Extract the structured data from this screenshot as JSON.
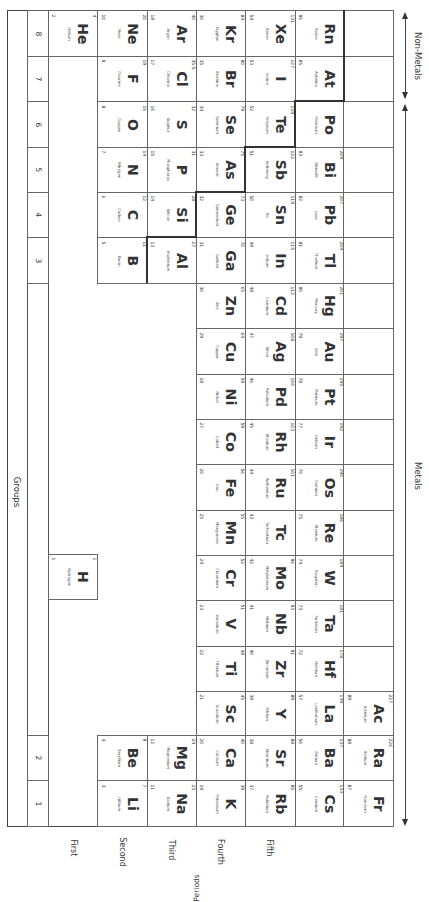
{
  "labels": {
    "groups": "Groups",
    "periods": "Periods",
    "metals": "Metals",
    "non_metals": "Non-Metals"
  },
  "group_numbers": [
    "8",
    "7",
    "6",
    "5",
    "4",
    "3",
    "2",
    "1"
  ],
  "period_labels": [
    "First",
    "Second",
    "Third",
    "Fourth",
    "Fifth"
  ],
  "elements": {
    "He": {
      "symbol": "He",
      "name": "Helium",
      "mass": "4",
      "number": "2"
    },
    "Ne": {
      "symbol": "Ne",
      "name": "Neon",
      "mass": "20",
      "number": "10"
    },
    "Ar": {
      "symbol": "Ar",
      "name": "Argon",
      "mass": "40",
      "number": "18"
    },
    "Kr": {
      "symbol": "Kr",
      "name": "Krypton",
      "mass": "84",
      "number": "36"
    },
    "Xe": {
      "symbol": "Xe",
      "name": "Xenon",
      "mass": "131",
      "number": "54"
    },
    "Rn": {
      "symbol": "Rn",
      "name": "Radon",
      "mass": "",
      "number": "86"
    },
    "F": {
      "symbol": "F",
      "name": "Fluorine",
      "mass": "19",
      "number": "9"
    },
    "Cl": {
      "symbol": "Cl",
      "name": "Chlorine",
      "mass": "35.5",
      "number": "17"
    },
    "Br": {
      "symbol": "Br",
      "name": "Bromine",
      "mass": "80",
      "number": "35"
    },
    "I": {
      "symbol": "I",
      "name": "Iodine",
      "mass": "127",
      "number": "53"
    },
    "At": {
      "symbol": "At",
      "name": "Astatine",
      "mass": "",
      "number": "85"
    },
    "O": {
      "symbol": "O",
      "name": "Oxygen",
      "mass": "16",
      "number": "8"
    },
    "S": {
      "symbol": "S",
      "name": "Sulphur",
      "mass": "32",
      "number": "16"
    },
    "Se": {
      "symbol": "Se",
      "name": "Selenium",
      "mass": "79",
      "number": "34"
    },
    "Te": {
      "symbol": "Te",
      "name": "Tellurium",
      "mass": "128",
      "number": "52"
    },
    "Po": {
      "symbol": "Po",
      "name": "Polonium",
      "mass": "",
      "number": ""
    },
    "N": {
      "symbol": "N",
      "name": "Nitrogen",
      "mass": "14",
      "number": "7"
    },
    "P": {
      "symbol": "P",
      "name": "Phosphorus",
      "mass": "31",
      "number": "15"
    },
    "As": {
      "symbol": "As",
      "name": "Arsenic",
      "mass": "75",
      "number": "33"
    },
    "Sb": {
      "symbol": "Sb",
      "name": "Antimony",
      "mass": "122",
      "number": "51"
    },
    "Bi": {
      "symbol": "Bi",
      "name": "Bismuth",
      "mass": "209",
      "number": "83"
    },
    "C": {
      "symbol": "C",
      "name": "Carbon",
      "mass": "12",
      "number": "6"
    },
    "Si": {
      "symbol": "Si",
      "name": "Silicon",
      "mass": "28",
      "number": "14"
    },
    "Ge": {
      "symbol": "Ge",
      "name": "Germanium",
      "mass": "73",
      "number": "32"
    },
    "Sn": {
      "symbol": "Sn",
      "name": "Tin",
      "mass": "119",
      "number": "50"
    },
    "Pb": {
      "symbol": "Pb",
      "name": "Lead",
      "mass": "207",
      "number": "82"
    },
    "B": {
      "symbol": "B",
      "name": "Boron",
      "mass": "11",
      "number": "5"
    },
    "Al": {
      "symbol": "Al",
      "name": "Aluminium",
      "mass": "27",
      "number": "13"
    },
    "Ga": {
      "symbol": "Ga",
      "name": "Gallium",
      "mass": "70",
      "number": "31"
    },
    "In": {
      "symbol": "In",
      "name": "Indium",
      "mass": "115",
      "number": "49"
    },
    "Tl": {
      "symbol": "Tl",
      "name": "Thallium",
      "mass": "204",
      "number": "81"
    },
    "Zn": {
      "symbol": "Zn",
      "name": "Zinc",
      "mass": "65",
      "number": "30"
    },
    "Cd": {
      "symbol": "Cd",
      "name": "Cadmium",
      "mass": "112",
      "number": "48"
    },
    "Hg": {
      "symbol": "Hg",
      "name": "Mercury",
      "mass": "201",
      "number": "80"
    },
    "Cu": {
      "symbol": "Cu",
      "name": "Copper",
      "mass": "64",
      "number": "29"
    },
    "Ag": {
      "symbol": "Ag",
      "name": "Silver",
      "mass": "108",
      "number": "47"
    },
    "Au": {
      "symbol": "Au",
      "name": "Gold",
      "mass": "197",
      "number": "79"
    },
    "Ni": {
      "symbol": "Ni",
      "name": "Nickel",
      "mass": "59",
      "number": "28"
    },
    "Pd": {
      "symbol": "Pd",
      "name": "Palladium",
      "mass": "106",
      "number": "46"
    },
    "Pt": {
      "symbol": "Pt",
      "name": "Platinum",
      "mass": "195",
      "number": "78"
    },
    "Co": {
      "symbol": "Co",
      "name": "Cobalt",
      "mass": "59",
      "number": "27"
    },
    "Rh": {
      "symbol": "Rh",
      "name": "Rhodium",
      "mass": "103",
      "number": "45"
    },
    "Ir": {
      "symbol": "Ir",
      "name": "Iridium",
      "mass": "192",
      "number": "77"
    },
    "Fe": {
      "symbol": "Fe",
      "name": "Iron",
      "mass": "56",
      "number": "26"
    },
    "Ru": {
      "symbol": "Ru",
      "name": "Ruthenium",
      "mass": "101",
      "number": "44"
    },
    "Os": {
      "symbol": "Os",
      "name": "Osmium",
      "mass": "190",
      "number": "76"
    },
    "Mn": {
      "symbol": "Mn",
      "name": "Manganese",
      "mass": "55",
      "number": "25"
    },
    "Tc": {
      "symbol": "Tc",
      "name": "Technetium",
      "mass": "",
      "number": "43"
    },
    "Re": {
      "symbol": "Re",
      "name": "Rhenium",
      "mass": "186",
      "number": "75"
    },
    "Cr": {
      "symbol": "Cr",
      "name": "Chromium",
      "mass": "52",
      "number": "24"
    },
    "Mo": {
      "symbol": "Mo",
      "name": "Molybdenum",
      "mass": "96",
      "number": "42"
    },
    "W": {
      "symbol": "W",
      "name": "Tungsten",
      "mass": "184",
      "number": "74"
    },
    "V": {
      "symbol": "V",
      "name": "Vanadium",
      "mass": "51",
      "number": "23"
    },
    "Nb": {
      "symbol": "Nb",
      "name": "Niobium",
      "mass": "93",
      "number": "41"
    },
    "Ta": {
      "symbol": "Ta",
      "name": "Tantalum",
      "mass": "181",
      "number": "73"
    },
    "Ti": {
      "symbol": "Ti",
      "name": "Titanium",
      "mass": "48",
      "number": "22"
    },
    "Zr": {
      "symbol": "Zr",
      "name": "Zirconium",
      "mass": "91",
      "number": "40"
    },
    "Hf": {
      "symbol": "Hf",
      "name": "Hafnium",
      "mass": "178",
      "number": "72"
    },
    "Sc": {
      "symbol": "Sc",
      "name": "Scandium",
      "mass": "45",
      "number": "21"
    },
    "Y": {
      "symbol": "Y",
      "name": "Yttrium",
      "mass": "89",
      "number": "39"
    },
    "La": {
      "symbol": "La",
      "name": "Lanthanum",
      "mass": "139",
      "number": "57"
    },
    "Ac": {
      "symbol": "Ac",
      "name": "Actinium",
      "mass": "227",
      "number": "89"
    },
    "Be": {
      "symbol": "Be",
      "name": "Beryllium",
      "mass": "9",
      "number": "4"
    },
    "Mg": {
      "symbol": "Mg",
      "name": "Magnesium",
      "mass": "24",
      "number": "12"
    },
    "Ca": {
      "symbol": "Ca",
      "name": "Calcium",
      "mass": "40",
      "number": "20"
    },
    "Sr": {
      "symbol": "Sr",
      "name": "Strontium",
      "mass": "88",
      "number": "38"
    },
    "Ba": {
      "symbol": "Ba",
      "name": "Barium",
      "mass": "137",
      "number": "56"
    },
    "Ra": {
      "symbol": "Ra",
      "name": "Radium",
      "mass": "226",
      "number": "88"
    },
    "Li": {
      "symbol": "Li",
      "name": "Lithium",
      "mass": "7",
      "number": "3"
    },
    "Na": {
      "symbol": "Na",
      "name": "Sodium",
      "mass": "23",
      "number": "11"
    },
    "K": {
      "symbol": "K",
      "name": "Potassium",
      "mass": "39",
      "number": "19"
    },
    "Rb": {
      "symbol": "Rb",
      "name": "Rubidium",
      "mass": "85",
      "number": "37"
    },
    "Cs": {
      "symbol": "Cs",
      "name": "Caesium",
      "mass": "133",
      "number": "55"
    },
    "Fr": {
      "symbol": "Fr",
      "name": "Francium",
      "mass": "",
      "number": "87"
    },
    "H": {
      "symbol": "H",
      "name": "Hydrogen",
      "mass": "1",
      "number": "1"
    }
  },
  "colors": {
    "line": "#444444",
    "text": "#333333",
    "background": "#ffffff"
  }
}
